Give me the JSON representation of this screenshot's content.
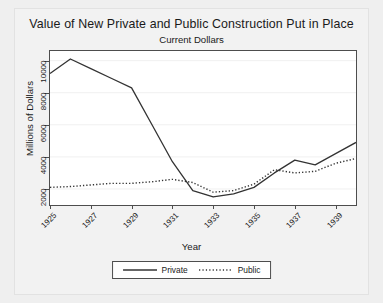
{
  "chart_data": {
    "type": "line",
    "title": "Value of New Private and Public Construction Put in Place",
    "subtitle": "Current Dollars",
    "xlabel": "Year",
    "ylabel": "Millions of Dollars",
    "grid": "horizontal",
    "legend_position": "below-axis-centered",
    "xlim": [
      1925,
      1940
    ],
    "ylim": [
      1000,
      10600
    ],
    "xticks": [
      "1925",
      "1927",
      "1929",
      "1931",
      "1933",
      "1935",
      "1937",
      "1939"
    ],
    "xtick_values": [
      1925,
      1927,
      1929,
      1931,
      1933,
      1935,
      1937,
      1939
    ],
    "yticks": [
      "2000",
      "4000",
      "6000",
      "8000",
      "10000"
    ],
    "ytick_values": [
      2000,
      4000,
      6000,
      8000,
      10000
    ],
    "x": [
      1925,
      1926,
      1927,
      1928,
      1929,
      1930,
      1931,
      1932,
      1933,
      1934,
      1935,
      1936,
      1937,
      1938,
      1939,
      1940
    ],
    "series": [
      {
        "name": "Private",
        "style": "solid",
        "color": "#333333",
        "values": [
          9200,
          10100,
          9500,
          8900,
          8300,
          6000,
          3700,
          1900,
          1500,
          1700,
          2100,
          3000,
          3800,
          3500,
          4200,
          4900
        ]
      },
      {
        "name": "Public",
        "style": "dotted",
        "color": "#333333",
        "values": [
          2100,
          2150,
          2250,
          2350,
          2350,
          2450,
          2600,
          2400,
          1800,
          1900,
          2300,
          3200,
          3000,
          3100,
          3600,
          3900
        ]
      }
    ]
  },
  "legend": {
    "entries": [
      {
        "label": "Private",
        "style": "solid"
      },
      {
        "label": "Public",
        "style": "dotted"
      }
    ]
  }
}
